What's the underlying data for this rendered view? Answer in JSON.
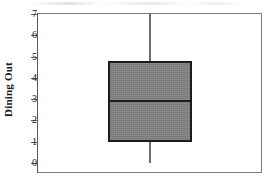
{
  "chart_data": {
    "type": "box",
    "title": "",
    "xlabel": "",
    "ylabel": "Dining Out",
    "ylim": [
      0,
      7.2
    ],
    "yticks": [
      0,
      1,
      2,
      3,
      4,
      5,
      6,
      7
    ],
    "ytick_labels": [
      "0",
      "1",
      "2",
      "3",
      "4",
      "5",
      "6",
      "7"
    ],
    "grid": false,
    "legend": "none",
    "categories": [
      ""
    ],
    "boxes": [
      {
        "name": "Dining Out",
        "min": 0,
        "q1": 1,
        "median": 2.9,
        "q3": 4.8,
        "max": 7,
        "outliers": [],
        "fill_color": "#808080",
        "edge_color": "#1c1c1c"
      }
    ]
  },
  "axis": {
    "y_label": "Dining Out",
    "ticks": [
      "7",
      "6",
      "5",
      "4",
      "3",
      "2",
      "1",
      "0"
    ]
  },
  "colors": {
    "box_fill": "#808080",
    "box_edge": "#1c1c1c",
    "whisker": "#6e6e6e",
    "frame": "#7d7d7d",
    "text": "#141414",
    "background": "#ffffff"
  }
}
